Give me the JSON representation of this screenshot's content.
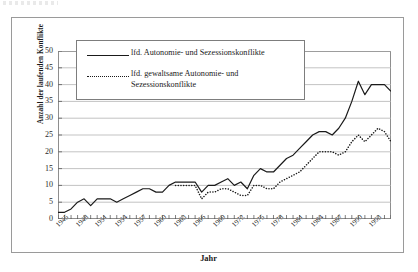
{
  "chart_data": {
    "type": "line",
    "title": "",
    "xlabel": "Jahr",
    "ylabel": "Anzahl der laufenden Konflikte",
    "xlim": [
      1945,
      1996
    ],
    "ylim": [
      0,
      50
    ],
    "grid": true,
    "legend_position": "top-left-inside",
    "x_tick_labels": [
      "1945",
      "1948",
      "1951",
      "1954",
      "1957",
      "1960",
      "1963",
      "1966",
      "1969",
      "1972",
      "1975",
      "1978",
      "1981",
      "1984",
      "1987",
      "1990",
      "1993"
    ],
    "y_tick_labels": [
      "0",
      "5",
      "10",
      "15",
      "20",
      "25",
      "30",
      "35",
      "40",
      "45",
      "50"
    ],
    "y_ticks": [
      0,
      5,
      10,
      15,
      20,
      25,
      30,
      35,
      40,
      45,
      50
    ],
    "x": [
      1945,
      1946,
      1947,
      1948,
      1949,
      1950,
      1951,
      1952,
      1953,
      1954,
      1955,
      1956,
      1957,
      1958,
      1959,
      1960,
      1961,
      1962,
      1963,
      1964,
      1965,
      1966,
      1967,
      1968,
      1969,
      1970,
      1971,
      1972,
      1973,
      1974,
      1975,
      1976,
      1977,
      1978,
      1979,
      1980,
      1981,
      1982,
      1983,
      1984,
      1985,
      1986,
      1987,
      1988,
      1989,
      1990,
      1991,
      1992,
      1993,
      1994,
      1995,
      1996
    ],
    "series": [
      {
        "name": "lfd. Autonomie- und Sezessionskonflikte",
        "style": "solid",
        "color": "#1a1a1a",
        "values": [
          2,
          2,
          3,
          5,
          6,
          4,
          6,
          6,
          6,
          5,
          6,
          7,
          8,
          9,
          9,
          8,
          8,
          10,
          11,
          11,
          11,
          11,
          8,
          10,
          10,
          11,
          12,
          10,
          11,
          9,
          13,
          15,
          14,
          14,
          16,
          18,
          19,
          21,
          23,
          25,
          26,
          26,
          25,
          27,
          30,
          35,
          41,
          37,
          40,
          40,
          40,
          38
        ]
      },
      {
        "name": "lfd. gewaltsame Autonomie- und Sezessionskonflikte",
        "style": "dotted",
        "color": "#1a1a1a",
        "values": [
          null,
          null,
          null,
          null,
          null,
          null,
          null,
          null,
          null,
          null,
          null,
          null,
          null,
          null,
          null,
          null,
          null,
          null,
          10,
          10,
          10,
          10,
          6,
          8,
          8,
          9,
          9,
          8,
          7,
          7,
          10,
          10,
          9,
          9,
          11,
          12,
          13,
          14,
          16,
          18,
          20,
          20,
          20,
          19,
          20,
          23,
          25,
          23,
          25,
          27,
          26,
          23
        ]
      }
    ]
  },
  "legend": {
    "items": [
      {
        "label": "lfd. Autonomie- und Sezessionskonflikte",
        "style": "solid"
      },
      {
        "label": "lfd. gewaltsame Autonomie- und Sezessionskonflikte",
        "style": "dotted"
      }
    ],
    "item2_line1": "lfd. gewaltsame Autonomie- und",
    "item2_line2": "Sezessionskonflikte"
  }
}
